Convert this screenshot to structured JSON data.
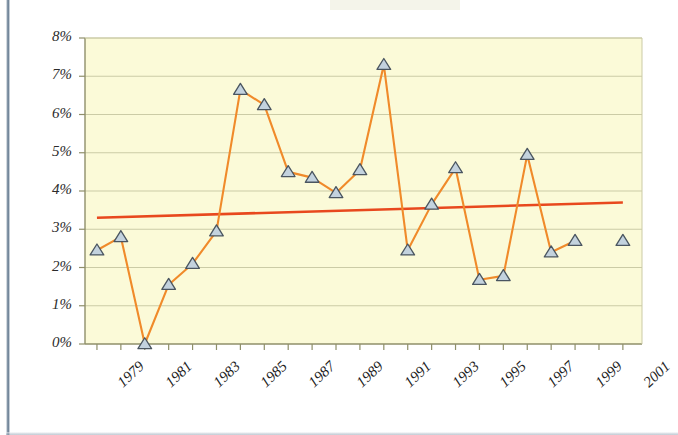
{
  "chart_data": {
    "type": "line",
    "title": "",
    "subtitle": "",
    "xlabel": "",
    "ylabel": "",
    "grid": true,
    "legend": "none",
    "xlim": [
      1978.5,
      2001.8
    ],
    "ylim": [
      0,
      8
    ],
    "y_tick_labels": [
      "8%",
      "7%",
      "6%",
      "5%",
      "4%",
      "3%",
      "2%",
      "1%",
      "0%"
    ],
    "y_tick_values": [
      8,
      7,
      6,
      5,
      4,
      3,
      2,
      1,
      0
    ],
    "x_tick_labels": [
      "1979",
      "1981",
      "1983",
      "1985",
      "1987",
      "1989",
      "1991",
      "1993",
      "1995",
      "1997",
      "1999",
      "2001"
    ],
    "x_tick_values": [
      1979,
      1981,
      1983,
      1985,
      1987,
      1989,
      1991,
      1993,
      1995,
      1997,
      1999,
      2001
    ],
    "x_minor_ticks": [
      1979,
      1980,
      1981,
      1982,
      1983,
      1984,
      1985,
      1986,
      1987,
      1988,
      1989,
      1990,
      1991,
      1992,
      1993,
      1994,
      1995,
      1996,
      1997,
      1998,
      1999,
      2000,
      2001
    ],
    "series": [
      {
        "name": "data-series",
        "marker": "triangle",
        "line_color": "#F08A2A",
        "marker_fill": "#c3d2de",
        "marker_edge": "#4a5560",
        "x": [
          1979,
          1980,
          1981,
          1982,
          1983,
          1984,
          1985,
          1986,
          1987,
          1988,
          1989,
          1990,
          1991,
          1992,
          1993,
          1994,
          1995,
          1996,
          1997,
          1998,
          1999
        ],
        "values": [
          2.45,
          2.8,
          0.0,
          1.55,
          2.1,
          2.95,
          6.65,
          6.25,
          4.5,
          4.35,
          3.95,
          4.55,
          7.3,
          2.45,
          3.65,
          4.6,
          1.68,
          1.78,
          4.95,
          2.4,
          2.7
        ]
      },
      {
        "name": "isolated-point",
        "marker": "triangle",
        "connected": false,
        "x": [
          2001
        ],
        "values": [
          2.7
        ]
      },
      {
        "name": "trendline",
        "type": "line",
        "line_color": "#E8481E",
        "marker": "none",
        "x": [
          1979,
          2001
        ],
        "values": [
          3.3,
          3.7
        ]
      }
    ],
    "colors": {
      "plot_background": "#FBFAD8",
      "gridline": "#CBCBA6",
      "axis": "#8f8f6a",
      "series_line": "#F08A2A",
      "trend_line": "#E8481E",
      "marker_fill": "#C3D2DE",
      "marker_edge": "#4A5560",
      "frame_bar": "#5D7389",
      "tick_text": "#1D1D1D"
    }
  }
}
